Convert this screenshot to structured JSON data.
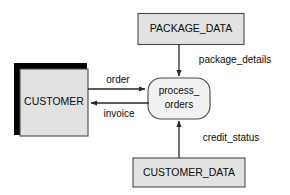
{
  "diagram": {
    "type": "data-flow-diagram",
    "title": "",
    "colors": {
      "store_fill": "#e2e2e2",
      "process_fill": "#f1f1f1",
      "shadow": "#000000",
      "stroke": "#4a4a4a",
      "flow_stroke": "#2a2a2a",
      "background": "#ffffff"
    },
    "nodes": {
      "customer_entity": {
        "label": "CUSTOMER",
        "shape": "shadowed-rectangle",
        "role": "external-entity"
      },
      "package_data_store": {
        "label": "PACKAGE_DATA",
        "shape": "rectangle",
        "role": "data-store"
      },
      "customer_data_store": {
        "label": "CUSTOMER_DATA",
        "shape": "rectangle",
        "role": "data-store"
      },
      "process_orders": {
        "label_line1": "process_",
        "label_line2": "orders",
        "shape": "rounded-rectangle",
        "role": "process"
      }
    },
    "flows": [
      {
        "id": "order",
        "label": "order",
        "from": "CUSTOMER",
        "to": "process_orders",
        "direction": "right"
      },
      {
        "id": "invoice",
        "label": "invoice",
        "from": "process_orders",
        "to": "CUSTOMER",
        "direction": "left"
      },
      {
        "id": "package_details",
        "label": "package_details",
        "from": "PACKAGE_DATA",
        "to": "process_orders",
        "direction": "down"
      },
      {
        "id": "credit_status",
        "label": "credit_status",
        "from": "CUSTOMER_DATA",
        "to": "process_orders",
        "direction": "up"
      }
    ]
  }
}
